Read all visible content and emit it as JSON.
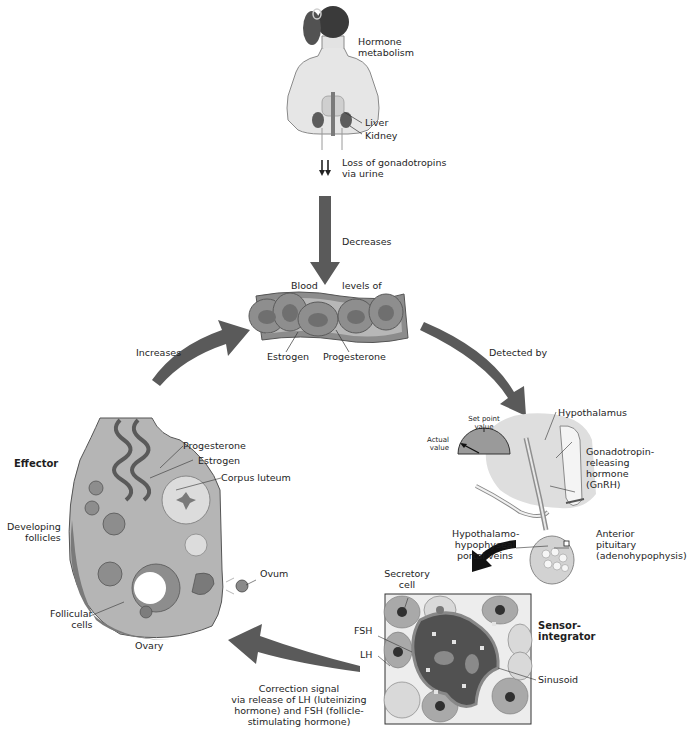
{
  "diagram": {
    "top_figure": {
      "heading": [
        "Hormone",
        "metabolism"
      ],
      "organs": [
        "Liver",
        "Kidney"
      ],
      "excretion_label": [
        "Loss of gonadotropins",
        "via urine"
      ]
    },
    "arrows": {
      "top_to_blood": "Decreases",
      "ovary_to_blood": "Increases",
      "blood_to_hypothalamus": "Detected by",
      "pituitary_to_ovary": [
        "Correction signal",
        "via release of LH (luteinizing",
        "hormone) and FSH (follicle-",
        "stimulating hormone)"
      ]
    },
    "blood_vessel": {
      "label_left": "Blood",
      "label_right": "levels of",
      "hormones": [
        "Estrogen",
        "Progesterone"
      ]
    },
    "sensor": {
      "gauge": {
        "set_point_label": [
          "Set point",
          "value"
        ],
        "actual_label": [
          "Actual",
          "value"
        ]
      },
      "hypothalamus": "Hypothalamus",
      "gnrh": [
        "Gonadotropin-",
        "releasing",
        "hormone",
        "(GnRH)"
      ],
      "portal_veins": [
        "Hypothalamo-",
        "hypophyseal",
        "portal veins"
      ],
      "anterior_pituitary": [
        "Anterior",
        "pituitary",
        "(adenohypophysis)"
      ],
      "role": [
        "Sensor-",
        "integrator"
      ],
      "inset_labels": {
        "secretory_cell": [
          "Secretory",
          "cell"
        ],
        "fsh": "FSH",
        "lh": "LH",
        "sinusoid": "Sinusoid"
      }
    },
    "effector": {
      "role": "Effector",
      "organ": "Ovary",
      "labels": {
        "progesterone": "Progesterone",
        "estrogen": "Estrogen",
        "corpus_luteum": "Corpus luteum",
        "developing_follicles": [
          "Developing",
          "follicles"
        ],
        "follicular_cells": [
          "Follicular",
          "cells"
        ],
        "ovum": "Ovum"
      }
    },
    "colors": {
      "arrow": "#5a5a5a",
      "tissue_light": "#c9c9c9",
      "tissue_mid": "#9a9a9a",
      "tissue_dark": "#5e5e5e",
      "background": "#ffffff"
    }
  }
}
